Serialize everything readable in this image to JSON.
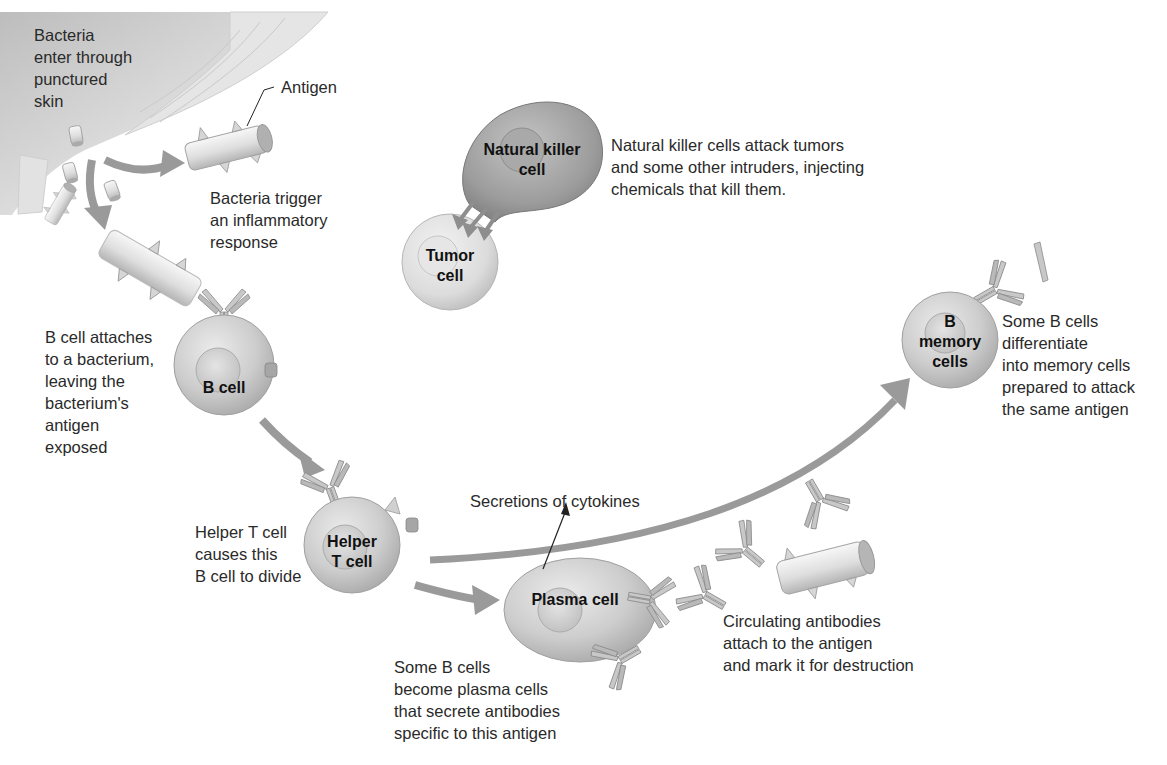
{
  "diagram": {
    "type": "immune-response-illustration",
    "colors": {
      "background": "#ffffff",
      "text": "#2a2a2a",
      "cell_fill": "#cfcfcf",
      "cell_edge": "#9a9a9a",
      "nk_cell_fill": "#9e9e9e",
      "arrow": "#9a9a9a",
      "antibody": "#b8b8b8",
      "skin": "#d9d9d9"
    },
    "captions": {
      "bacteria_enter": "Bacteria\nenter through\npunctured\nskin",
      "antigen": "Antigen",
      "bacteria_trigger": "Bacteria trigger\nan inflammatory\nresponse",
      "nk_description": "Natural killer cells attack tumors\nand some other intruders, injecting\nchemicals that kill them.",
      "b_cell_attaches": "B cell attaches\nto a bacterium,\nleaving the\nbacterium's\nantigen\nexposed",
      "helper_t_causes": "Helper T cell\ncauses this\nB cell to divide",
      "cytokines": "Secretions of cytokines",
      "plasma_description": "Some B cells\nbecome plasma cells\nthat secrete antibodies\nspecific to this antigen",
      "circulating_antibodies": "Circulating antibodies\nattach to the antigen\nand mark it for destruction",
      "memory_description": "Some B cells\ndifferentiate\ninto memory cells\nprepared to attack\nthe same antigen"
    },
    "cells": {
      "natural_killer": "Natural killer\ncell",
      "tumor": "Tumor\ncell",
      "b_cell": "B cell",
      "helper_t": "Helper\nT cell",
      "plasma": "Plasma cell",
      "b_memory": "B\nmemory\ncells"
    }
  }
}
